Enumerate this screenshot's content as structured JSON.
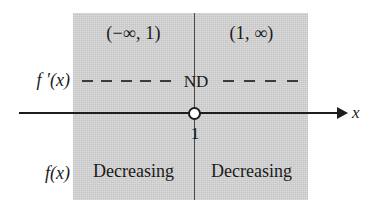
{
  "figure": {
    "name": "sign-chart-number-line",
    "variable_label": "x",
    "critical_value": "1",
    "axis_arrow_direction": "right",
    "critical_point_marker": "open-circle",
    "colors": {
      "panel_background": "#cfcfcf",
      "line": "#1d1d1d",
      "divider": "#4a4a4a",
      "text": "#1a1a1a",
      "circle_fill": "#ffffff"
    }
  },
  "row_labels": {
    "derivative": "f ′(x)",
    "function": "f(x)"
  },
  "intervals": [
    {
      "header": "(−∞, 1)",
      "sign_marks": "dashes",
      "behavior": "Decreasing"
    },
    {
      "header": "(1, ∞)",
      "sign_marks": "dashes",
      "behavior": "Decreasing"
    }
  ],
  "derivative_row": {
    "left_dash_count": 5,
    "center_marker": "ND",
    "right_dash_count": 4
  },
  "chart_data": {
    "type": "table",
    "title": "",
    "columns": [
      "(−∞, 1)",
      "(1, ∞)"
    ],
    "rows": [
      {
        "label": "f ′(x)",
        "values": [
          "−",
          "−"
        ],
        "center": "ND"
      },
      {
        "label": "f(x)",
        "values": [
          "Decreasing",
          "Decreasing"
        ]
      }
    ],
    "x_axis": {
      "label": "x",
      "critical_points": [
        "1"
      ],
      "marker": "open circle"
    }
  }
}
